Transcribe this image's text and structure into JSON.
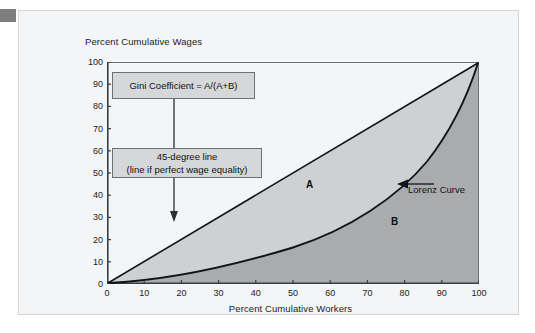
{
  "figure": {
    "y_axis_title": "Percent Cumulative Wages",
    "x_axis_title": "Percent Cumulative Workers",
    "callouts": {
      "gini": "Gini Coefficient = A/(A+B)",
      "line45_top": "45-degree line",
      "line45_bottom": "(line if perfect wage equality)"
    },
    "region_labels": {
      "a": "A",
      "b": "B"
    },
    "curve_annotation": "Lorenz Curve",
    "colors": {
      "page_background": "#ffffff",
      "card_background": "#f4f5f6",
      "card_border": "#d3d5d7",
      "corner_tab": "#7d7d7d",
      "plot_background": "#f4f5f6",
      "area_a_fill": "#cfd0d1",
      "area_b_fill": "#a9abad",
      "axis_line": "#3a3c3e",
      "curve_line": "#121314",
      "callout_fill": "#d6d7d8",
      "callout_border": "#6d6f72",
      "text": "#1b1b1b"
    }
  },
  "chart_data": {
    "type": "line",
    "title": "",
    "xlabel": "Percent Cumulative Workers",
    "ylabel": "Percent Cumulative Wages",
    "xlim": [
      0,
      100
    ],
    "ylim": [
      0,
      100
    ],
    "grid": false,
    "legend": "none",
    "x_ticks": [
      0,
      10,
      20,
      30,
      40,
      50,
      60,
      70,
      80,
      90,
      100
    ],
    "y_ticks": [
      0,
      10,
      20,
      30,
      40,
      50,
      60,
      70,
      80,
      90,
      100
    ],
    "x": [
      0,
      10,
      20,
      30,
      40,
      50,
      60,
      70,
      80,
      90,
      95,
      100
    ],
    "series": [
      {
        "name": "Lorenz Curve",
        "values": [
          0,
          1,
          3,
          6,
          10,
          16,
          23,
          33,
          47,
          66,
          79,
          100
        ]
      },
      {
        "name": "45-degree line (line if perfect wage equality)",
        "values": [
          0,
          10,
          20,
          30,
          40,
          50,
          60,
          70,
          80,
          90,
          95,
          100
        ]
      }
    ],
    "annotations": [
      {
        "text": "Gini Coefficient = A/(A+B)",
        "x": 3,
        "y": 86
      },
      {
        "text": "45-degree line",
        "x": 22,
        "y": 55
      },
      {
        "text": "(line if perfect wage equality)",
        "x": 22,
        "y": 49
      },
      {
        "text": "A",
        "x": 54,
        "y": 42
      },
      {
        "text": "B",
        "x": 77,
        "y": 26
      },
      {
        "text": "Lorenz Curve",
        "x": 83,
        "y": 40
      }
    ],
    "shaded_regions": [
      {
        "name": "A",
        "description": "area between 45-degree line and Lorenz Curve",
        "fill": "#cfd0d1"
      },
      {
        "name": "B",
        "description": "area under the Lorenz Curve",
        "fill": "#a9abad"
      }
    ]
  }
}
